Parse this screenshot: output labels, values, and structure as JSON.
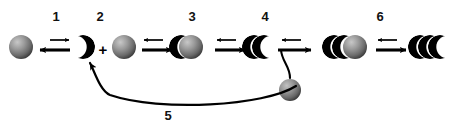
{
  "figure": {
    "background_color": "#ffffff",
    "ink_color": "#000000",
    "sphere_light_color": "#b9b9b9",
    "sphere_mid_color": "#6f6f6f",
    "sphere_dark_color": "#2a2a2a",
    "width": 458,
    "height": 129
  },
  "step_labels": [
    {
      "text": "1",
      "x": 44,
      "y": 9
    },
    {
      "text": "2",
      "x": 88,
      "y": 9
    },
    {
      "text": "3",
      "x": 180,
      "y": 9
    },
    {
      "text": "4",
      "x": 253,
      "y": 9
    },
    {
      "text": "6",
      "x": 368,
      "y": 9
    },
    {
      "text": "5",
      "x": 156,
      "y": 108
    }
  ],
  "operators": [
    {
      "symbol": "+",
      "x": 96,
      "y": 43
    }
  ],
  "objects": [
    {
      "name": "sphere-start",
      "kind": "shaded-sphere",
      "cx": 21,
      "cy": 47,
      "r": 12
    },
    {
      "name": "crescent-step2",
      "kind": "black-crescent",
      "cx": 83,
      "cy": 47,
      "r": 12
    },
    {
      "name": "sphere-second",
      "kind": "shaded-sphere",
      "cx": 124,
      "cy": 47,
      "r": 12
    },
    {
      "name": "crescent-plus-sphere-step3",
      "kind": "crescent-over-sphere",
      "cx": 186,
      "cy": 47,
      "r": 12
    },
    {
      "name": "double-crescent-step4",
      "kind": "two-crescents",
      "cx": 259,
      "cy": 47,
      "r": 12
    },
    {
      "name": "sphere-released",
      "kind": "shaded-sphere",
      "cx": 290,
      "cy": 90,
      "r": 11
    },
    {
      "name": "double-crescent-with-sphere-step6",
      "kind": "two-crescents-over-sphere",
      "cx": 345,
      "cy": 47,
      "r": 12
    },
    {
      "name": "triple-crescent-final",
      "kind": "three-crescents",
      "cx": 424,
      "cy": 47,
      "r": 12
    }
  ],
  "arrows": [
    {
      "name": "arrow-pair-1",
      "type": "reversible",
      "main_direction": "left",
      "minor_direction": "right",
      "x1": 38,
      "x2": 70,
      "y_main": 50,
      "y_minor": 40
    },
    {
      "name": "arrow-pair-2",
      "type": "reversible",
      "main_direction": "right",
      "minor_direction": "left",
      "x1": 140,
      "x2": 172,
      "y_main": 50,
      "y_minor": 40
    },
    {
      "name": "arrow-pair-3",
      "type": "reversible",
      "main_direction": "right",
      "minor_direction": "left",
      "x1": 213,
      "x2": 245,
      "y_main": 50,
      "y_minor": 40
    },
    {
      "name": "arrow-pair-4",
      "type": "reversible-with-release",
      "main_direction": "right",
      "minor_direction": "left",
      "x1": 276,
      "x2": 310,
      "y_main": 50,
      "y_minor": 40
    },
    {
      "name": "arrow-pair-5",
      "type": "reversible",
      "main_direction": "right",
      "minor_direction": "left",
      "x1": 374,
      "x2": 406,
      "y_main": 50,
      "y_minor": 40
    }
  ],
  "recycle_arc": {
    "name": "recycle-arc-step5",
    "from_x": 292,
    "from_y": 84,
    "to_x": 90,
    "to_y": 62,
    "label": "5"
  },
  "release_hook": {
    "name": "release-hook",
    "from_x": 290,
    "from_y": 78,
    "to_x": 284,
    "to_y": 50
  }
}
